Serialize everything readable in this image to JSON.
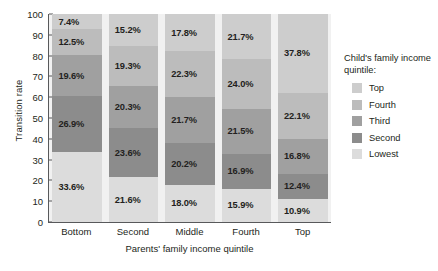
{
  "chart_data": {
    "type": "bar",
    "stacked": true,
    "title": "",
    "xlabel": "Parents' family income quintile",
    "ylabel": "Transition rate",
    "ylim": [
      0,
      100
    ],
    "yticks": [
      100,
      90,
      80,
      70,
      60,
      50,
      40,
      30,
      20,
      10,
      0
    ],
    "grid": false,
    "legend_position": "right",
    "legend_title": "Child's family income quintile:",
    "categories": [
      "Bottom",
      "Second",
      "Middle",
      "Fourth",
      "Top"
    ],
    "series": [
      {
        "name": "Lowest",
        "color": "#dcdcdc",
        "values": [
          33.6,
          21.6,
          18.0,
          15.9,
          10.9
        ],
        "labels": [
          "33.6%",
          "21.6%",
          "18.0%",
          "15.9%",
          "10.9%"
        ]
      },
      {
        "name": "Second",
        "color": "#8c8c8c",
        "values": [
          26.9,
          23.6,
          20.2,
          16.9,
          12.4
        ],
        "labels": [
          "26.9%",
          "23.6%",
          "20.2%",
          "16.9%",
          "12.4%"
        ]
      },
      {
        "name": "Third",
        "color": "#a0a0a0",
        "values": [
          19.6,
          20.3,
          21.7,
          21.5,
          16.8
        ],
        "labels": [
          "19.6%",
          "20.3%",
          "21.7%",
          "21.5%",
          "16.8%"
        ]
      },
      {
        "name": "Fourth",
        "color": "#bcbcbc",
        "values": [
          12.5,
          19.3,
          22.3,
          24.0,
          22.1
        ],
        "labels": [
          "12.5%",
          "19.3%",
          "22.3%",
          "24.0%",
          "22.1%"
        ]
      },
      {
        "name": "Top",
        "color": "#cdcdcd",
        "values": [
          7.4,
          15.2,
          17.8,
          21.7,
          37.8
        ],
        "labels": [
          "7.4%",
          "15.2%",
          "17.8%",
          "21.7%",
          "37.8%"
        ]
      }
    ],
    "legend_entries": [
      {
        "label": "Top",
        "color": "#cdcdcd"
      },
      {
        "label": "Fourth",
        "color": "#bcbcbc"
      },
      {
        "label": "Third",
        "color": "#a0a0a0"
      },
      {
        "label": "Second",
        "color": "#8c8c8c"
      },
      {
        "label": "Lowest",
        "color": "#dcdcdc"
      }
    ]
  }
}
